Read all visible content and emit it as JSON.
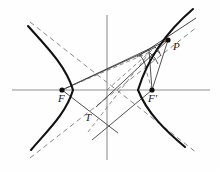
{
  "figure": {
    "width": 219,
    "height": 171,
    "background_color": "#fefefe",
    "curve_color": "#111111",
    "asymptote_color": "#8a8a8a",
    "axis_color": "#8f8f8f",
    "ray_color": "#333333",
    "labels": [
      {
        "id": "P",
        "text": "P",
        "x": 174,
        "y": 36,
        "note": "point on right branch"
      },
      {
        "id": "F",
        "text": "F",
        "x": 58,
        "y": 95,
        "note": "left focus"
      },
      {
        "id": "Fp",
        "text": "F'",
        "x": 149,
        "y": 95,
        "note": "right focus"
      },
      {
        "id": "T",
        "text": "T",
        "x": 86,
        "y": 113,
        "note": "tangent intersection point"
      }
    ],
    "points": {
      "center": {
        "x": 107,
        "y": 90
      },
      "focus_left": {
        "x": 62,
        "y": 90
      },
      "focus_right": {
        "x": 152,
        "y": 90
      },
      "vertex_left": {
        "x": 73,
        "y": 90
      },
      "vertex_right": {
        "x": 138,
        "y": 90
      },
      "P": {
        "x": 168,
        "y": 40
      },
      "T": {
        "x": 96,
        "y": 106
      }
    },
    "axes": {
      "horizontal": {
        "x1": 12,
        "y1": 90,
        "x2": 210,
        "y2": 90
      },
      "vertical": {
        "x1": 107,
        "y1": 15,
        "x2": 107,
        "y2": 160
      }
    },
    "asymptotes": [
      {
        "id": "asymptote-up-right",
        "x1": 30,
        "y1": 22,
        "x2": 196,
        "y2": 152
      },
      {
        "id": "asymptote-down-right",
        "x1": 30,
        "y1": 158,
        "x2": 196,
        "y2": 28
      }
    ],
    "hyperbola": {
      "type": "hyperbola",
      "a": 31,
      "b": 24,
      "c": 45,
      "orientation": "horizontal",
      "branches": [
        "left",
        "right"
      ]
    },
    "annotations": {
      "angle_arc_at_P": "equal angles marked with tick arcs",
      "tangent_line": "tangent to right branch through P",
      "focal_rays": [
        "F to P",
        "F' to P"
      ]
    }
  }
}
